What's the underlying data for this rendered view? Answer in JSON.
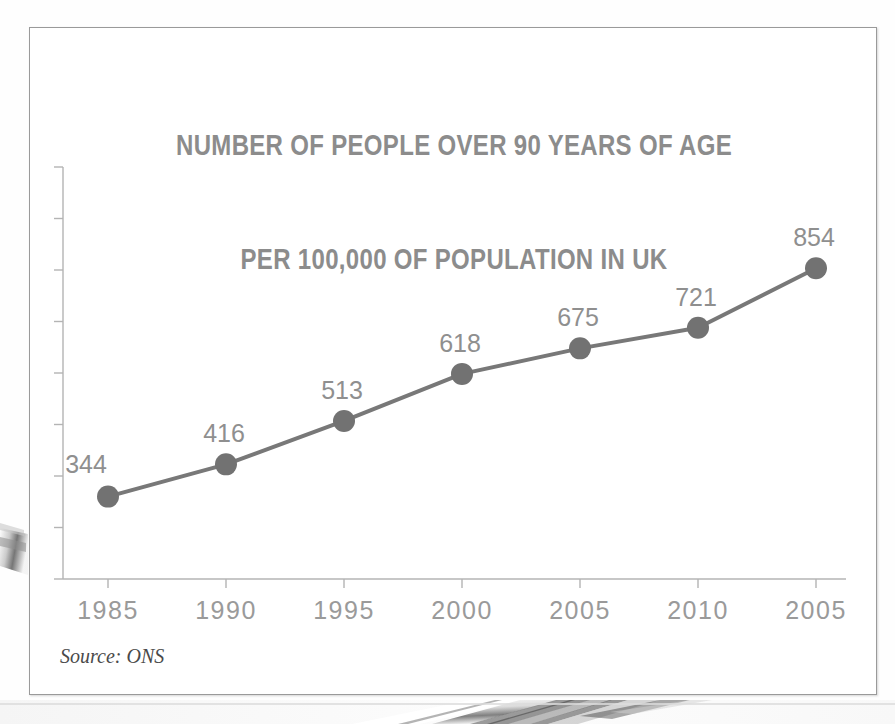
{
  "figure": {
    "title_line_1": "NUMBER OF PEOPLE OVER 90 YEARS OF AGE",
    "title_line_2": "PER 100,000 OF POPULATION IN UK",
    "source_note": "Source: ONS"
  },
  "colors": {
    "title": "#8c8c8c",
    "line": "#787878",
    "marker": "#727272",
    "label": "#8f8f8f",
    "axis": "#b4b4b4",
    "frame": "#9a9a9a",
    "background": "#ffffff"
  },
  "chart_data": {
    "type": "line",
    "title": "NUMBER OF PEOPLE OVER 90 YEARS OF AGE PER 100,000 OF POPULATION IN UK",
    "subtitle": "",
    "xlabel": "",
    "ylabel": "",
    "source": "Source: ONS",
    "categories": [
      "1985",
      "1990",
      "1995",
      "2000",
      "2005",
      "2010",
      "2005"
    ],
    "values": [
      344,
      416,
      513,
      618,
      675,
      721,
      854
    ],
    "point_labels": [
      "344",
      "416",
      "513",
      "618",
      "675",
      "721",
      "854"
    ],
    "series": [
      {
        "name": "People aged over 90 per 100,000 population",
        "values": [
          344,
          416,
          513,
          618,
          675,
          721,
          854
        ]
      }
    ],
    "ylim": [
      160,
      1080
    ],
    "y_tick_count": 9,
    "y_tick_labels": [],
    "grid": false,
    "legend": false,
    "legend_position": "none",
    "marker": "circle",
    "marker_radius": 11
  }
}
